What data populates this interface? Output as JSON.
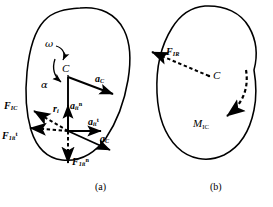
{
  "figure": {
    "background_color": "#ffffff",
    "stroke_color": "#000000"
  },
  "captions": [
    {
      "id": "caption-a",
      "label": "(a)",
      "x": 95,
      "y": 186
    },
    {
      "id": "caption-b",
      "label": "(b)",
      "x": 210,
      "y": 186
    }
  ],
  "panel_a": {
    "name": "panel-a-rigid-body-with-inertia-forces",
    "body_outline_name": "rigid-body-outline-a",
    "center_point_label": "C",
    "labels": {
      "omega": "ω",
      "alpha": "α",
      "center": "C",
      "a_C_top": {
        "base": "a",
        "sub": "C",
        "sup": ""
      },
      "a_C_lower": {
        "base": "a",
        "sub": "C",
        "sup": ""
      },
      "r_i": {
        "base": "r",
        "sub": "i",
        "sup": ""
      },
      "a_it_n": {
        "base": "a",
        "sub": "it",
        "sup": "n"
      },
      "a_it_t": {
        "base": "a",
        "sub": "it",
        "sup": "t"
      },
      "F_IC": {
        "base": "F",
        "sub": "IC",
        "sup": ""
      },
      "F_1it_t": {
        "base": "F",
        "sub": "1it",
        "sup": "t"
      },
      "F_1it_n": {
        "base": "F",
        "sub": "1it",
        "sup": "n"
      }
    },
    "elements": [
      {
        "name": "omega-curved-arrow",
        "kind": "curved-arrow",
        "meaning": "angular velocity"
      },
      {
        "name": "alpha-curved-arrow",
        "kind": "curved-arrow",
        "meaning": "angular acceleration"
      },
      {
        "name": "acceleration-vector-aC-top",
        "kind": "solid-arrow"
      },
      {
        "name": "acceleration-vector-aC-lower",
        "kind": "solid-arrow"
      },
      {
        "name": "position-vector-ri",
        "kind": "solid-line"
      },
      {
        "name": "acceleration-vector-ait-normal",
        "kind": "solid-arrow"
      },
      {
        "name": "acceleration-vector-ait-tangential",
        "kind": "solid-arrow"
      },
      {
        "name": "inertia-force-FIC",
        "kind": "dashed-arrow"
      },
      {
        "name": "inertia-force-F1it-tangential",
        "kind": "dashed-arrow"
      },
      {
        "name": "inertia-force-F1it-normal",
        "kind": "dashed-arrow"
      }
    ]
  },
  "panel_b": {
    "name": "panel-b-resultant-force-and-moment",
    "body_outline_name": "rigid-body-outline-b",
    "center_point_label": "C",
    "labels": {
      "center": "C",
      "F_IR": {
        "base": "F",
        "sub": "IR",
        "sup": ""
      },
      "M_IC": {
        "base": "M",
        "sub": "IC",
        "sup": ""
      }
    },
    "elements": [
      {
        "name": "resultant-inertia-force-FIR",
        "kind": "dashed-arrow"
      },
      {
        "name": "resultant-inertia-moment-MIC",
        "kind": "dashed-curved-arrow"
      }
    ]
  }
}
